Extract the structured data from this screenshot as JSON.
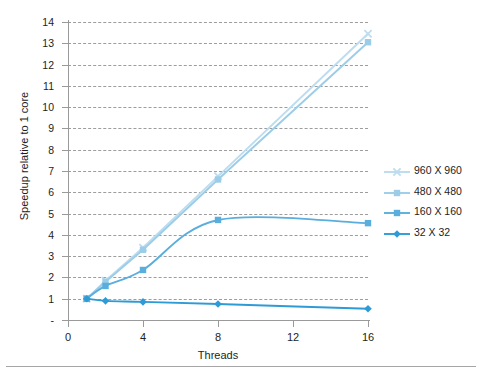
{
  "chart_data": {
    "type": "line",
    "title": "",
    "xlabel": "Threads",
    "ylabel": "Speedup relative to 1 core",
    "x": [
      1,
      2,
      4,
      8,
      16
    ],
    "xlim": [
      0,
      16
    ],
    "ylim": [
      0,
      14
    ],
    "x_ticks": [
      "0",
      "4",
      "8",
      "12",
      "16"
    ],
    "x_tick_values": [
      0,
      4,
      8,
      12,
      16
    ],
    "y_ticks": [
      "-",
      "1",
      "2",
      "3",
      "4",
      "5",
      "6",
      "7",
      "8",
      "9",
      "10",
      "11",
      "12",
      "13",
      "14"
    ],
    "y_tick_values": [
      0,
      1,
      2,
      3,
      4,
      5,
      6,
      7,
      8,
      9,
      10,
      11,
      12,
      13,
      14
    ],
    "grid": "horizontal-dashed",
    "legend_position": "right",
    "series": [
      {
        "name": "960 X 960",
        "color": "#bcdcef",
        "marker": "x",
        "values": [
          1.0,
          1.85,
          3.4,
          6.75,
          13.45
        ]
      },
      {
        "name": "480 X 480",
        "color": "#9ccde8",
        "marker": "square",
        "values": [
          1.0,
          1.8,
          3.3,
          6.6,
          13.05
        ]
      },
      {
        "name": "160 X 160",
        "color": "#59aedd",
        "marker": "square",
        "values": [
          1.0,
          1.6,
          2.35,
          4.7,
          4.55
        ]
      },
      {
        "name": "32 X 32",
        "color": "#2e9bd6",
        "marker": "diamond",
        "values": [
          1.0,
          0.9,
          0.85,
          0.75,
          0.53
        ]
      }
    ]
  },
  "axes": {
    "x_title": "Threads",
    "y_title": "Speedup relative to 1 core"
  },
  "legend": {
    "entries": [
      {
        "label": "960 X 960"
      },
      {
        "label": "480 X 480"
      },
      {
        "label": "160 X 160"
      },
      {
        "label": "32 X 32"
      }
    ]
  }
}
